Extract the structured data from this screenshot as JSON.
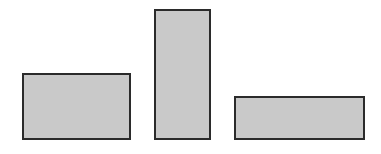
{
  "diagram": {
    "background": "#ffffff",
    "fill_color": "#c9c9c9",
    "stroke_color": "#2b2b2b",
    "shapes": [
      {
        "id": "rect-wide-left",
        "type": "rectangle",
        "x": 22,
        "y": 73,
        "width": 109,
        "height": 67
      },
      {
        "id": "rect-tall-middle",
        "type": "rectangle",
        "x": 154,
        "y": 9,
        "width": 57,
        "height": 131
      },
      {
        "id": "rect-wide-right",
        "type": "rectangle",
        "x": 234,
        "y": 96,
        "width": 131,
        "height": 44
      }
    ]
  }
}
